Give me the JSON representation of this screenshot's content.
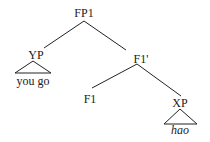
{
  "tree": {
    "root": "FP1",
    "nodes": {
      "fp1": "FP1",
      "yp": "YP",
      "yp_leaf": "you go",
      "f1bar": "F1'",
      "f1": "F1",
      "xp": "XP",
      "xp_leaf": "hao"
    },
    "edges": [
      [
        "FP1",
        "YP"
      ],
      [
        "FP1",
        "F1'"
      ],
      [
        "F1'",
        "F1"
      ],
      [
        "F1'",
        "XP"
      ]
    ],
    "triangles": [
      "YP",
      "XP"
    ]
  }
}
